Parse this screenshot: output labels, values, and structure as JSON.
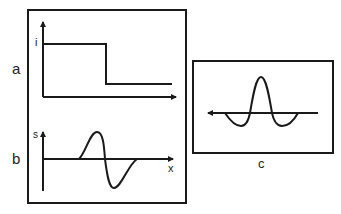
{
  "figure": {
    "panels": [
      {
        "id": "a",
        "label": "a",
        "y_axis_label": "i",
        "curve": "step-down"
      },
      {
        "id": "b",
        "label": "b",
        "y_axis_label": "s",
        "x_axis_label": "x",
        "curve": "bipolar-pulse"
      },
      {
        "id": "c",
        "label": "c",
        "curve": "central-peak-with-side-lobes",
        "axis_direction": "left"
      }
    ]
  },
  "colors": {
    "stroke": "#1a1a1a",
    "background": "#ffffff"
  }
}
